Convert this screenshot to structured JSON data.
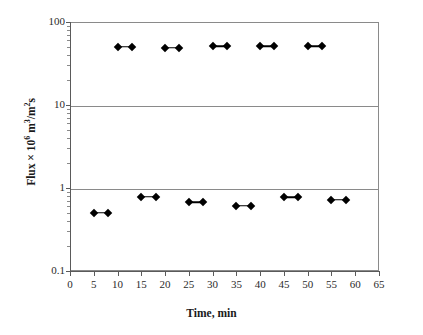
{
  "chart_data": {
    "type": "scatter",
    "title": "",
    "xlabel": "Time, min",
    "ylabel": "Flux × 10⁶ m³/m²s",
    "ylabel_parts": {
      "prefix": "Flux × 10",
      "exponent": "6",
      "unit_pre": " m",
      "unit_exp1": "3",
      "unit_mid": "/m",
      "unit_exp2": "2",
      "unit_post": "s"
    },
    "x_scale": "linear",
    "y_scale": "log",
    "xlim": [
      0,
      65
    ],
    "ylim": [
      0.1,
      100
    ],
    "grid": "horizontal-decades",
    "legend": "none",
    "xticks": [
      0,
      5,
      10,
      15,
      20,
      25,
      30,
      35,
      40,
      45,
      50,
      55,
      60,
      65
    ],
    "xtick_labels": [
      "0",
      "5",
      "10",
      "15",
      "20",
      "25",
      "30",
      "35",
      "40",
      "45",
      "50",
      "55",
      "60",
      "65"
    ],
    "yticks": [
      0.1,
      1,
      10,
      100
    ],
    "ytick_labels": [
      "0.1",
      "1",
      "10",
      "100"
    ],
    "gridlines_at": [
      10,
      1
    ],
    "marker_style": "filled-diamond",
    "marker_color": "#000000",
    "line_color": "#000000",
    "series": [
      {
        "name": "upper",
        "segments": [
          {
            "x0": 10,
            "x1": 13,
            "y": 50
          },
          {
            "x0": 20,
            "x1": 23,
            "y": 49
          },
          {
            "x0": 30,
            "x1": 33,
            "y": 51
          },
          {
            "x0": 40,
            "x1": 43,
            "y": 51
          },
          {
            "x0": 50,
            "x1": 53,
            "y": 51
          }
        ]
      },
      {
        "name": "lower",
        "segments": [
          {
            "x0": 5,
            "x1": 8,
            "y": 0.5
          },
          {
            "x0": 15,
            "x1": 18,
            "y": 0.78
          },
          {
            "x0": 25,
            "x1": 28,
            "y": 0.67
          },
          {
            "x0": 35,
            "x1": 38,
            "y": 0.61
          },
          {
            "x0": 45,
            "x1": 48,
            "y": 0.77
          },
          {
            "x0": 55,
            "x1": 58,
            "y": 0.72
          }
        ]
      }
    ]
  }
}
